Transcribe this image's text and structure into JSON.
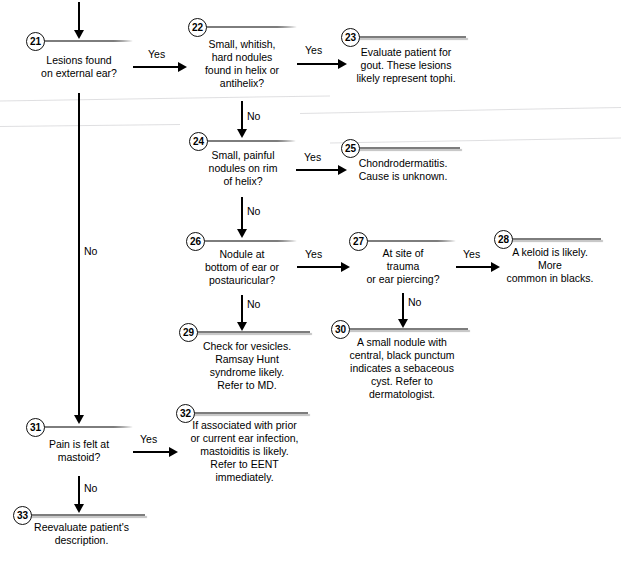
{
  "diagram": {
    "colors": {
      "node_fill": "#c9c9c9",
      "node_border": "#7d7d7d",
      "connector": "#000000",
      "background": "#ffffff"
    },
    "nodes": [
      {
        "id": "21",
        "shape": "hexagon",
        "text": "Lesions found\non external ear?"
      },
      {
        "id": "22",
        "shape": "hexagon",
        "text": "Small, whitish,\nhard nodules\nfound in helix or\nantihelix?"
      },
      {
        "id": "23",
        "shape": "rectangle",
        "text": "Evaluate patient for\ngout. These lesions\nlikely represent tophi."
      },
      {
        "id": "24",
        "shape": "hexagon",
        "text": "Small, painful\nnodules on rim\nof helix?"
      },
      {
        "id": "25",
        "shape": "rectangle",
        "text": "Chondrodermatitis.\nCause is unknown."
      },
      {
        "id": "26",
        "shape": "hexagon",
        "text": "Nodule at\nbottom of ear or\npostauricular?"
      },
      {
        "id": "27",
        "shape": "hexagon",
        "text": "At site of trauma\nor ear piercing?"
      },
      {
        "id": "28",
        "shape": "rectangle",
        "text": "A keloid is likely. More\ncommon in blacks."
      },
      {
        "id": "29",
        "shape": "rectangle",
        "text": "Check for vesicles.\nRamsay Hunt\nsyndrome likely.\nRefer to MD."
      },
      {
        "id": "30",
        "shape": "rectangle",
        "text": "A small nodule with\ncentral, black punctum\nindicates a sebaceous\ncyst. Refer to\ndermatologist."
      },
      {
        "id": "31",
        "shape": "hexagon",
        "text": "Pain is felt at\nmastoid?"
      },
      {
        "id": "32",
        "shape": "rectangle",
        "text": "If associated with prior\nor current ear infection,\nmastoiditis is likely.\nRefer to EENT\nimmediately."
      },
      {
        "id": "33",
        "shape": "rectangle",
        "text": "Reevaluate patient's\ndescription."
      }
    ],
    "edge_labels": {
      "e21_yes": "Yes",
      "e21_no": "No",
      "e22_yes": "Yes",
      "e22_no": "No",
      "e24_yes": "Yes",
      "e24_no": "No",
      "e26_yes": "Yes",
      "e26_no": "No",
      "e27_yes": "Yes",
      "e27_no": "No",
      "e31_yes": "Yes",
      "e31_no": "No"
    }
  }
}
